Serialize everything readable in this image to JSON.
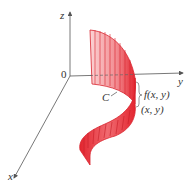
{
  "figure": {
    "axes": {
      "x_label": "x",
      "y_label": "y",
      "z_label": "z",
      "origin_label": "0"
    },
    "curve_label": "C",
    "height_label": "f(x, y)",
    "point_label": "(x, y)",
    "colors": {
      "surface": "#e8303a",
      "surface_light": "#f7b5b8",
      "axis": "#555555"
    }
  }
}
